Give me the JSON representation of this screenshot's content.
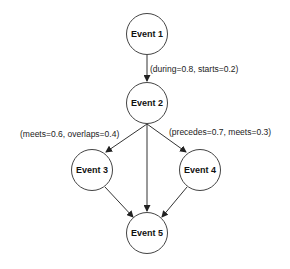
{
  "diagram": {
    "type": "directed-graph",
    "nodes": [
      {
        "id": "e1",
        "label": "Event 1"
      },
      {
        "id": "e2",
        "label": "Event 2"
      },
      {
        "id": "e3",
        "label": "Event 3"
      },
      {
        "id": "e4",
        "label": "Event 4"
      },
      {
        "id": "e5",
        "label": "Event 5"
      }
    ],
    "edges": [
      {
        "from": "e1",
        "to": "e2",
        "label": "(during=0.8, starts=0.2)"
      },
      {
        "from": "e2",
        "to": "e3",
        "label": "(meets=0.6, overlaps=0.4)"
      },
      {
        "from": "e2",
        "to": "e4",
        "label": "(precedes=0.7, meets=0.3)"
      },
      {
        "from": "e2",
        "to": "e5",
        "label": ""
      },
      {
        "from": "e3",
        "to": "e5",
        "label": ""
      },
      {
        "from": "e4",
        "to": "e5",
        "label": ""
      }
    ]
  }
}
